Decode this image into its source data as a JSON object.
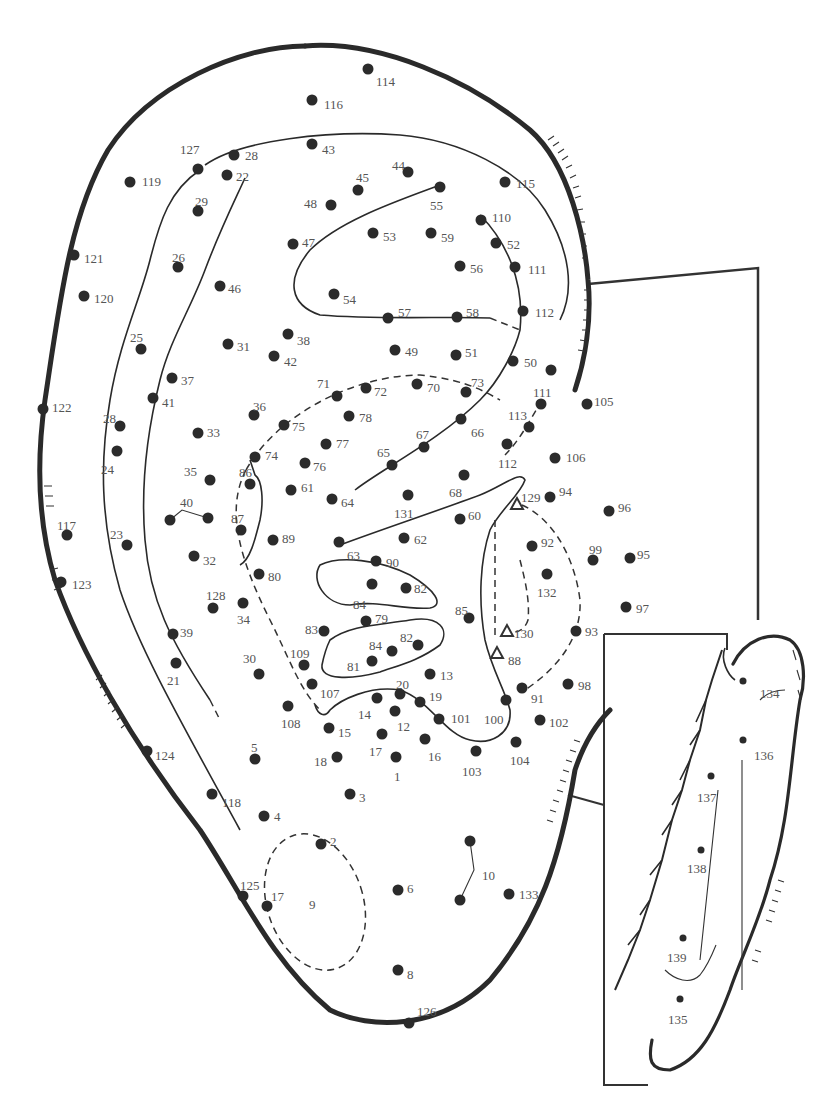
{
  "diagram": {
    "colors": {
      "ink": "#2b2b2b",
      "label": "#555555",
      "background": "#ffffff"
    },
    "points": [
      {
        "id": "114",
        "x": 368,
        "y": 69,
        "lx": 376,
        "ly": 82
      },
      {
        "id": "116",
        "x": 312,
        "y": 100,
        "lx": 324,
        "ly": 105
      },
      {
        "id": "127",
        "x": 198,
        "y": 169,
        "lx": 180,
        "ly": 150
      },
      {
        "id": "28",
        "x": 234,
        "y": 155,
        "lx": 245,
        "ly": 156
      },
      {
        "id": "43",
        "x": 312,
        "y": 144,
        "lx": 322,
        "ly": 150
      },
      {
        "id": "22",
        "x": 227,
        "y": 175,
        "lx": 236,
        "ly": 177
      },
      {
        "id": "119",
        "x": 130,
        "y": 182,
        "lx": 142,
        "ly": 182
      },
      {
        "id": "44",
        "x": 408,
        "y": 172,
        "lx": 392,
        "ly": 166
      },
      {
        "id": "45",
        "x": 358,
        "y": 190,
        "lx": 356,
        "ly": 178
      },
      {
        "id": "48",
        "x": 331,
        "y": 205,
        "lx": 304,
        "ly": 204
      },
      {
        "id": "29",
        "x": 198,
        "y": 211,
        "lx": 195,
        "ly": 202
      },
      {
        "id": "55",
        "x": 440,
        "y": 187,
        "lx": 430,
        "ly": 206
      },
      {
        "id": "115",
        "x": 505,
        "y": 182,
        "lx": 516,
        "ly": 184
      },
      {
        "id": "110",
        "x": 481,
        "y": 220,
        "lx": 492,
        "ly": 218
      },
      {
        "id": "53",
        "x": 373,
        "y": 233,
        "lx": 383,
        "ly": 237
      },
      {
        "id": "59",
        "x": 431,
        "y": 233,
        "lx": 441,
        "ly": 238
      },
      {
        "id": "52",
        "x": 496,
        "y": 243,
        "lx": 507,
        "ly": 245
      },
      {
        "id": "47",
        "x": 293,
        "y": 244,
        "lx": 302,
        "ly": 243
      },
      {
        "id": "121",
        "x": 74,
        "y": 255,
        "lx": 84,
        "ly": 259
      },
      {
        "id": "26",
        "x": 178,
        "y": 267,
        "lx": 172,
        "ly": 258
      },
      {
        "id": "56",
        "x": 460,
        "y": 266,
        "lx": 470,
        "ly": 269
      },
      {
        "id": "111",
        "x": 515,
        "y": 267,
        "lx": 528,
        "ly": 270
      },
      {
        "id": "46",
        "x": 220,
        "y": 286,
        "lx": 228,
        "ly": 289
      },
      {
        "id": "54",
        "x": 334,
        "y": 294,
        "lx": 343,
        "ly": 300
      },
      {
        "id": "120",
        "x": 84,
        "y": 296,
        "lx": 94,
        "ly": 299
      },
      {
        "id": "57",
        "x": 388,
        "y": 318,
        "lx": 398,
        "ly": 313
      },
      {
        "id": "58",
        "x": 457,
        "y": 317,
        "lx": 466,
        "ly": 313
      },
      {
        "id": "112",
        "x": 523,
        "y": 311,
        "lx": 535,
        "ly": 313
      },
      {
        "id": "38",
        "x": 288,
        "y": 334,
        "lx": 297,
        "ly": 341
      },
      {
        "id": "25",
        "x": 141,
        "y": 349,
        "lx": 130,
        "ly": 338
      },
      {
        "id": "31",
        "x": 228,
        "y": 344,
        "lx": 237,
        "ly": 347
      },
      {
        "id": "42",
        "x": 274,
        "y": 356,
        "lx": 284,
        "ly": 362
      },
      {
        "id": "49",
        "x": 395,
        "y": 350,
        "lx": 405,
        "ly": 352
      },
      {
        "id": "51",
        "x": 456,
        "y": 355,
        "lx": 465,
        "ly": 353
      },
      {
        "id": "50",
        "x": 513,
        "y": 361,
        "lx": 524,
        "ly": 363
      },
      {
        "id": "37",
        "x": 172,
        "y": 378,
        "lx": 181,
        "ly": 381
      },
      {
        "id": "71",
        "x": 337,
        "y": 396,
        "lx": 317,
        "ly": 384
      },
      {
        "id": "72",
        "x": 366,
        "y": 388,
        "lx": 374,
        "ly": 392
      },
      {
        "id": "70",
        "x": 417,
        "y": 384,
        "lx": 427,
        "ly": 388
      },
      {
        "id": "73",
        "x": 466,
        "y": 392,
        "lx": 471,
        "ly": 383
      },
      {
        "id": "unlabeled-a",
        "x": 551,
        "y": 370,
        "lx": null,
        "ly": null
      },
      {
        "id": "41",
        "x": 153,
        "y": 398,
        "lx": 162,
        "ly": 403
      },
      {
        "id": "122",
        "x": 43,
        "y": 409,
        "lx": 52,
        "ly": 408
      },
      {
        "id": "36",
        "x": 254,
        "y": 415,
        "lx": 253,
        "ly": 407
      },
      {
        "id": "78",
        "x": 349,
        "y": 416,
        "lx": 359,
        "ly": 418
      },
      {
        "id": "75",
        "x": 284,
        "y": 425,
        "lx": 292,
        "ly": 427
      },
      {
        "id": "111",
        "x": 541,
        "y": 404,
        "lx": 533,
        "ly": 393
      },
      {
        "id": "105",
        "x": 587,
        "y": 404,
        "lx": 594,
        "ly": 402
      },
      {
        "id": "66",
        "x": 461,
        "y": 419,
        "lx": 471,
        "ly": 433
      },
      {
        "id": "28",
        "x": 120,
        "y": 426,
        "lx": 103,
        "ly": 419
      },
      {
        "id": "33",
        "x": 198,
        "y": 433,
        "lx": 207,
        "ly": 433
      },
      {
        "id": "113",
        "x": 529,
        "y": 427,
        "lx": 508,
        "ly": 416
      },
      {
        "id": "77",
        "x": 326,
        "y": 444,
        "lx": 336,
        "ly": 444
      },
      {
        "id": "67",
        "x": 424,
        "y": 447,
        "lx": 416,
        "ly": 435
      },
      {
        "id": "112",
        "x": 507,
        "y": 444,
        "lx": 498,
        "ly": 464
      },
      {
        "id": "24",
        "x": 117,
        "y": 451,
        "lx": 101,
        "ly": 470
      },
      {
        "id": "74",
        "x": 255,
        "y": 457,
        "lx": 265,
        "ly": 456
      },
      {
        "id": "76",
        "x": 305,
        "y": 463,
        "lx": 313,
        "ly": 467
      },
      {
        "id": "65",
        "x": 392,
        "y": 465,
        "lx": 377,
        "ly": 453
      },
      {
        "id": "106",
        "x": 555,
        "y": 458,
        "lx": 566,
        "ly": 458
      },
      {
        "id": "35",
        "x": 210,
        "y": 480,
        "lx": 184,
        "ly": 472
      },
      {
        "id": "86",
        "x": 250,
        "y": 484,
        "lx": 239,
        "ly": 473
      },
      {
        "id": "61",
        "x": 291,
        "y": 490,
        "lx": 301,
        "ly": 488
      },
      {
        "id": "68",
        "x": 464,
        "y": 475,
        "lx": 449,
        "ly": 493
      },
      {
        "id": "64",
        "x": 332,
        "y": 499,
        "lx": 341,
        "ly": 503
      },
      {
        "id": "131",
        "x": 408,
        "y": 495,
        "lx": 394,
        "ly": 514
      },
      {
        "id": "94",
        "x": 550,
        "y": 497,
        "lx": 559,
        "ly": 492
      },
      {
        "id": "96",
        "x": 609,
        "y": 511,
        "lx": 618,
        "ly": 508
      },
      {
        "id": "40",
        "x": 170,
        "y": 520,
        "lx": 180,
        "ly": 503
      },
      {
        "id": "40b",
        "x": 208,
        "y": 518,
        "lx": null,
        "ly": null
      },
      {
        "id": "87",
        "x": 241,
        "y": 530,
        "lx": 231,
        "ly": 519
      },
      {
        "id": "60",
        "x": 460,
        "y": 519,
        "lx": 468,
        "ly": 516
      },
      {
        "id": "117",
        "x": 67,
        "y": 535,
        "lx": 57,
        "ly": 526
      },
      {
        "id": "89",
        "x": 273,
        "y": 540,
        "lx": 282,
        "ly": 539
      },
      {
        "id": "23",
        "x": 127,
        "y": 545,
        "lx": 110,
        "ly": 535
      },
      {
        "id": "63",
        "x": 339,
        "y": 542,
        "lx": 347,
        "ly": 556
      },
      {
        "id": "62",
        "x": 404,
        "y": 538,
        "lx": 414,
        "ly": 540
      },
      {
        "id": "92",
        "x": 532,
        "y": 546,
        "lx": 541,
        "ly": 543
      },
      {
        "id": "32",
        "x": 194,
        "y": 556,
        "lx": 203,
        "ly": 561
      },
      {
        "id": "90",
        "x": 376,
        "y": 561,
        "lx": 386,
        "ly": 563
      },
      {
        "id": "99",
        "x": 593,
        "y": 560,
        "lx": 589,
        "ly": 550
      },
      {
        "id": "95",
        "x": 630,
        "y": 558,
        "lx": 637,
        "ly": 555
      },
      {
        "id": "123",
        "x": 61,
        "y": 582,
        "lx": 72,
        "ly": 585
      },
      {
        "id": "80",
        "x": 259,
        "y": 574,
        "lx": 268,
        "ly": 577
      },
      {
        "id": "84",
        "x": 372,
        "y": 584,
        "lx": 353,
        "ly": 605
      },
      {
        "id": "82",
        "x": 406,
        "y": 588,
        "lx": 414,
        "ly": 589
      },
      {
        "id": "132",
        "x": 547,
        "y": 574,
        "lx": 537,
        "ly": 593
      },
      {
        "id": "128",
        "x": 213,
        "y": 608,
        "lx": 206,
        "ly": 596
      },
      {
        "id": "34",
        "x": 243,
        "y": 603,
        "lx": 237,
        "ly": 620
      },
      {
        "id": "85",
        "x": 469,
        "y": 618,
        "lx": 455,
        "ly": 611
      },
      {
        "id": "97",
        "x": 626,
        "y": 607,
        "lx": 636,
        "ly": 609
      },
      {
        "id": "79",
        "x": 366,
        "y": 621,
        "lx": 375,
        "ly": 619
      },
      {
        "id": "83",
        "x": 324,
        "y": 631,
        "lx": 305,
        "ly": 630
      },
      {
        "id": "39",
        "x": 173,
        "y": 634,
        "lx": 180,
        "ly": 633
      },
      {
        "id": "93",
        "x": 576,
        "y": 631,
        "lx": 585,
        "ly": 632
      },
      {
        "id": "84",
        "x": 392,
        "y": 651,
        "lx": 369,
        "ly": 646
      },
      {
        "id": "82",
        "x": 418,
        "y": 645,
        "lx": 400,
        "ly": 638
      },
      {
        "id": "21",
        "x": 176,
        "y": 663,
        "lx": 167,
        "ly": 681
      },
      {
        "id": "30",
        "x": 259,
        "y": 674,
        "lx": 243,
        "ly": 659
      },
      {
        "id": "109",
        "x": 304,
        "y": 665,
        "lx": 290,
        "ly": 654
      },
      {
        "id": "81",
        "x": 372,
        "y": 661,
        "lx": 347,
        "ly": 667
      },
      {
        "id": "13",
        "x": 430,
        "y": 674,
        "lx": 440,
        "ly": 676
      },
      {
        "id": "98",
        "x": 568,
        "y": 684,
        "lx": 578,
        "ly": 686
      },
      {
        "id": "107",
        "x": 312,
        "y": 684,
        "lx": 320,
        "ly": 694
      },
      {
        "id": "20",
        "x": 400,
        "y": 694,
        "lx": 396,
        "ly": 685
      },
      {
        "id": "91",
        "x": 522,
        "y": 688,
        "lx": 531,
        "ly": 699
      },
      {
        "id": "14",
        "x": 377,
        "y": 698,
        "lx": 358,
        "ly": 715
      },
      {
        "id": "19",
        "x": 420,
        "y": 702,
        "lx": 429,
        "ly": 697
      },
      {
        "id": "108",
        "x": 288,
        "y": 706,
        "lx": 281,
        "ly": 724
      },
      {
        "id": "100",
        "x": 506,
        "y": 700,
        "lx": 484,
        "ly": 720
      },
      {
        "id": "12",
        "x": 395,
        "y": 711,
        "lx": 397,
        "ly": 727
      },
      {
        "id": "101",
        "x": 439,
        "y": 719,
        "lx": 451,
        "ly": 719
      },
      {
        "id": "102",
        "x": 540,
        "y": 720,
        "lx": 549,
        "ly": 723
      },
      {
        "id": "15",
        "x": 329,
        "y": 728,
        "lx": 338,
        "ly": 733
      },
      {
        "id": "17",
        "x": 382,
        "y": 734,
        "lx": 369,
        "ly": 752
      },
      {
        "id": "16",
        "x": 425,
        "y": 739,
        "lx": 428,
        "ly": 757
      },
      {
        "id": "104",
        "x": 516,
        "y": 742,
        "lx": 510,
        "ly": 761
      },
      {
        "id": "103",
        "x": 476,
        "y": 751,
        "lx": 462,
        "ly": 772
      },
      {
        "id": "124",
        "x": 147,
        "y": 751,
        "lx": 155,
        "ly": 756
      },
      {
        "id": "5",
        "x": 255,
        "y": 759,
        "lx": 251,
        "ly": 748
      },
      {
        "id": "18",
        "x": 337,
        "y": 757,
        "lx": 314,
        "ly": 762
      },
      {
        "id": "1",
        "x": 396,
        "y": 757,
        "lx": 394,
        "ly": 777
      },
      {
        "id": "118",
        "x": 212,
        "y": 794,
        "lx": 222,
        "ly": 803
      },
      {
        "id": "3",
        "x": 350,
        "y": 794,
        "lx": 359,
        "ly": 798
      },
      {
        "id": "4",
        "x": 264,
        "y": 816,
        "lx": 274,
        "ly": 817
      },
      {
        "id": "2",
        "x": 321,
        "y": 844,
        "lx": 330,
        "ly": 842
      },
      {
        "id": "10",
        "x": 470,
        "y": 841,
        "lx": 482,
        "ly": 876
      },
      {
        "id": "10b",
        "x": 460,
        "y": 900,
        "lx": null,
        "ly": null
      },
      {
        "id": "6",
        "x": 398,
        "y": 890,
        "lx": 407,
        "ly": 889
      },
      {
        "id": "133",
        "x": 509,
        "y": 894,
        "lx": 519,
        "ly": 895
      },
      {
        "id": "125",
        "x": 243,
        "y": 896,
        "lx": 240,
        "ly": 886
      },
      {
        "id": "17",
        "x": 267,
        "y": 906,
        "lx": 271,
        "ly": 897
      },
      {
        "id": "9",
        "x": null,
        "y": null,
        "lx": 309,
        "ly": 905
      },
      {
        "id": "8",
        "x": 398,
        "y": 970,
        "lx": 407,
        "ly": 975
      },
      {
        "id": "126",
        "x": 409,
        "y": 1023,
        "lx": 417,
        "ly": 1012
      }
    ],
    "triangles": [
      {
        "id": "129",
        "x": 517,
        "y": 504,
        "lx": 521,
        "ly": 498
      },
      {
        "id": "130",
        "x": 507,
        "y": 631,
        "lx": 514,
        "ly": 634
      },
      {
        "id": "88",
        "x": 497,
        "y": 653,
        "lx": 508,
        "ly": 661
      }
    ],
    "inset_points": [
      {
        "id": "134",
        "x": 743,
        "y": 681,
        "lx": 760,
        "ly": 694
      },
      {
        "id": "136",
        "x": 743,
        "y": 740,
        "lx": 754,
        "ly": 756
      },
      {
        "id": "137",
        "x": 711,
        "y": 776,
        "lx": 697,
        "ly": 798
      },
      {
        "id": "138",
        "x": 701,
        "y": 850,
        "lx": 687,
        "ly": 869
      },
      {
        "id": "139",
        "x": 683,
        "y": 938,
        "lx": 667,
        "ly": 958
      },
      {
        "id": "135",
        "x": 680,
        "y": 999,
        "lx": 668,
        "ly": 1020
      }
    ]
  }
}
